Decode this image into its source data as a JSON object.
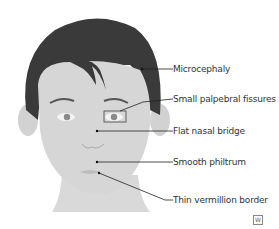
{
  "figure": {
    "labels": [
      {
        "id": "microcephaly",
        "text": "Microcephaly"
      },
      {
        "id": "small-palpebral-fissures",
        "text": "Small palpebral fissures"
      },
      {
        "id": "flat-nasal-bridge",
        "text": "Flat nasal bridge"
      },
      {
        "id": "smooth-philtrum",
        "text": "Smooth philtrum"
      },
      {
        "id": "thin-vermillion-border",
        "text": "Thin vermillion border"
      }
    ],
    "logo_text": "W"
  },
  "colors": {
    "hair": "#3a3a3a",
    "skin": "#d6d6d6",
    "line": "#222222",
    "text": "#333333"
  }
}
